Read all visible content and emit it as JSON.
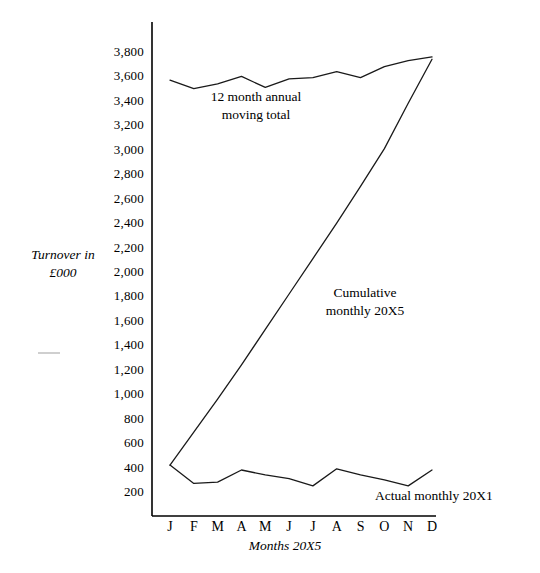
{
  "chart_title": "",
  "axis": {
    "y_title_line1": "Turnover in",
    "y_title_line2": "£000",
    "x_title": "Months 20X5"
  },
  "annotations": {
    "moving_total_line1": "12 month annual",
    "moving_total_line2": "moving total",
    "cumulative_line1": "Cumulative",
    "cumulative_line2": "monthly 20X5",
    "actual_monthly": "Actual monthly 20X1"
  },
  "chart_data": {
    "type": "line",
    "title": "",
    "xlabel": "Months 20X5",
    "ylabel": "Turnover in £000",
    "categories": [
      "J",
      "F",
      "M",
      "A",
      "M",
      "J",
      "J",
      "A",
      "S",
      "O",
      "N",
      "D"
    ],
    "ylim": [
      0,
      3900
    ],
    "yticks": [
      200,
      400,
      600,
      800,
      1000,
      1200,
      1400,
      1600,
      1800,
      2000,
      2200,
      2400,
      2600,
      2800,
      3000,
      3200,
      3400,
      3600,
      3800
    ],
    "ytick_labels": [
      "200",
      "400",
      "600",
      "800",
      "1,000",
      "1,200",
      "1,400",
      "1,600",
      "1,800",
      "2,000",
      "2,200",
      "2,400",
      "2,600",
      "2,800",
      "3,000",
      "3,200",
      "3,400",
      "3,600",
      "3,800"
    ],
    "grid": false,
    "legend": "annotations",
    "series": [
      {
        "name": "12 month annual moving total",
        "values": [
          3570,
          3500,
          3540,
          3600,
          3510,
          3580,
          3590,
          3640,
          3590,
          3680,
          3730,
          3760
        ]
      },
      {
        "name": "Cumulative monthly 20X5",
        "values": [
          420,
          690,
          960,
          1240,
          1530,
          1820,
          2110,
          2400,
          2700,
          3010,
          3380,
          3740
        ]
      },
      {
        "name": "Actual monthly 20X1",
        "values": [
          420,
          270,
          280,
          380,
          340,
          310,
          250,
          390,
          340,
          300,
          250,
          380
        ]
      }
    ]
  },
  "colors": {
    "line": "#1a1a1a",
    "axis": "#000000",
    "background": "#ffffff"
  }
}
